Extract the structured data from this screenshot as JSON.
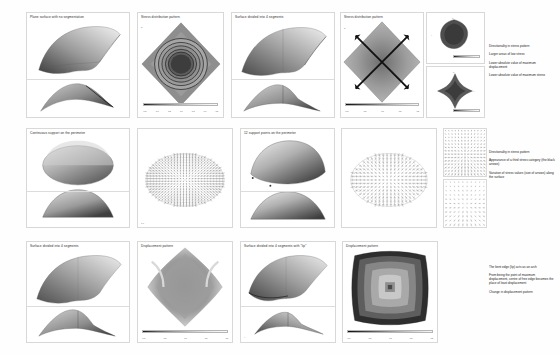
{
  "document": {
    "title": "Structural analysis comparison sheet",
    "subject": "Shell surface segmentation, stress and displacement patterns"
  },
  "rows": [
    {
      "id": "row-1",
      "panels": [
        {
          "id": "r1p1",
          "caption": "Plane surface with no segmentation",
          "kind": "surface-perspective-elevation"
        },
        {
          "id": "r1p2",
          "caption": "Stress distribution pattern",
          "kind": "contour-diamond-concentric"
        },
        {
          "id": "r1p3",
          "caption": "Surface divided into 4 segments",
          "kind": "surface-perspective-elevation"
        },
        {
          "id": "r1p4",
          "caption": "Stress distribution pattern",
          "kind": "contour-diamond-crossarrows"
        },
        {
          "id": "r1p5",
          "caption": "",
          "kind": "thumb-blob"
        },
        {
          "id": "r1p6",
          "caption": "",
          "kind": "thumb-star"
        }
      ],
      "notes": [
        "Directionality in stress pattern",
        "Larger areas of low stress",
        "Lower absolute value of maximum displacement",
        "Lower absolute value of maximum stress"
      ]
    },
    {
      "id": "row-2",
      "panels": [
        {
          "id": "r2p1",
          "caption": "Continuous support on the perimeter",
          "kind": "dome-perspective-elevation"
        },
        {
          "id": "r2p2",
          "caption": "",
          "kind": "dome-vectorfield-dense"
        },
        {
          "id": "r2p3",
          "caption": "12 support points on the perimeter",
          "kind": "dome-perspective-elevation"
        },
        {
          "id": "r2p4",
          "caption": "",
          "kind": "dome-vectorfield-sparse"
        },
        {
          "id": "r2p5",
          "caption": "",
          "kind": "detail-vectors-top"
        },
        {
          "id": "r2p6",
          "caption": "",
          "kind": "detail-vectors-bottom"
        }
      ],
      "notes": [
        "Directionality in stress pattern",
        "Appearance of a third stress category (the black arrows)",
        "Variation of stress values (size of arrows) along the surface"
      ]
    },
    {
      "id": "row-3",
      "panels": [
        {
          "id": "r3p1",
          "caption": "Surface divided into 4 segments",
          "kind": "surface-perspective-elevation"
        },
        {
          "id": "r3p2",
          "caption": "Displacement pattern",
          "kind": "contour-diamond-soft"
        },
        {
          "id": "r3p3",
          "caption": "Surface divided into 4 segments with \"lip\"",
          "kind": "surface-perspective-elevation"
        },
        {
          "id": "r3p4",
          "caption": "Displacement pattern",
          "kind": "contour-square-banded"
        }
      ],
      "notes": [
        "The bent edge (lip) acts as an arch",
        "From being the point of maximum displacement, centre of free edge becomes the place of least displacement",
        "Change in displacement pattern"
      ]
    }
  ],
  "colorbar": {
    "ticks": [
      "-1.5",
      "-1.0",
      "-0.5",
      "0.0",
      "0.5",
      "1.0",
      "1.5"
    ],
    "ticks_short": [
      "0",
      "1"
    ],
    "low_color": "#1a1a1a",
    "high_color": "#fafafa"
  },
  "tags": {
    "axis_z": "Z",
    "axis_y": "Y",
    "axis_x": "X"
  }
}
